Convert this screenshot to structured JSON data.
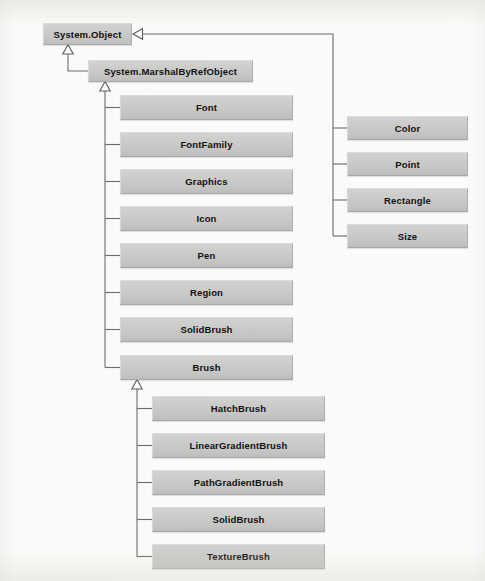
{
  "diagram": {
    "type": "uml-class-inheritance",
    "style": {
      "background": "#fbfbfa",
      "node_fill": "#c9c9c7",
      "node_border": "#a9a9a7",
      "line_color": "#6b6b6b",
      "text_color": "#111111"
    },
    "nodes": [
      {
        "id": "system-object",
        "label": "System.Object",
        "x": 43,
        "y": 23,
        "w": 89,
        "h": 22
      },
      {
        "id": "system-marshalbyrefobject",
        "label": "System.MarshalByRefObject",
        "x": 88,
        "y": 60,
        "w": 165,
        "h": 22
      },
      {
        "id": "font",
        "label": "Font",
        "x": 120,
        "y": 95,
        "w": 173,
        "h": 25
      },
      {
        "id": "fontfamily",
        "label": "FontFamily",
        "x": 120,
        "y": 132,
        "w": 173,
        "h": 25
      },
      {
        "id": "graphics",
        "label": "Graphics",
        "x": 120,
        "y": 169,
        "w": 173,
        "h": 25
      },
      {
        "id": "icon",
        "label": "Icon",
        "x": 120,
        "y": 206,
        "w": 173,
        "h": 25
      },
      {
        "id": "pen",
        "label": "Pen",
        "x": 120,
        "y": 243,
        "w": 173,
        "h": 25
      },
      {
        "id": "region",
        "label": "Region",
        "x": 120,
        "y": 280,
        "w": 173,
        "h": 25
      },
      {
        "id": "solidbrush-top",
        "label": "SolidBrush",
        "x": 120,
        "y": 317,
        "w": 173,
        "h": 25
      },
      {
        "id": "brush",
        "label": "Brush",
        "x": 120,
        "y": 355,
        "w": 173,
        "h": 25
      },
      {
        "id": "color",
        "label": "Color",
        "x": 347,
        "y": 116,
        "w": 121,
        "h": 24
      },
      {
        "id": "point",
        "label": "Point",
        "x": 347,
        "y": 152,
        "w": 121,
        "h": 24
      },
      {
        "id": "rectangle",
        "label": "Rectangle",
        "x": 347,
        "y": 188,
        "w": 121,
        "h": 24
      },
      {
        "id": "size",
        "label": "Size",
        "x": 347,
        "y": 224,
        "w": 121,
        "h": 24
      },
      {
        "id": "hatchbrush",
        "label": "HatchBrush",
        "x": 152,
        "y": 396,
        "w": 173,
        "h": 25
      },
      {
        "id": "lineargradientbrush",
        "label": "LinearGradientBrush",
        "x": 152,
        "y": 433,
        "w": 173,
        "h": 25
      },
      {
        "id": "pathgradientbrush",
        "label": "PathGradientBrush",
        "x": 152,
        "y": 470,
        "w": 173,
        "h": 25
      },
      {
        "id": "solidbrush-bottom",
        "label": "SolidBrush",
        "x": 152,
        "y": 507,
        "w": 173,
        "h": 25
      },
      {
        "id": "texturebrush",
        "label": "TextureBrush",
        "x": 152,
        "y": 544,
        "w": 173,
        "h": 25
      }
    ],
    "edges": [
      {
        "from": "system-marshalbyrefobject",
        "to": "system-object",
        "kind": "generalization"
      },
      {
        "from": "font",
        "to": "system-marshalbyrefobject",
        "kind": "generalization"
      },
      {
        "from": "fontfamily",
        "to": "system-marshalbyrefobject",
        "kind": "generalization"
      },
      {
        "from": "graphics",
        "to": "system-marshalbyrefobject",
        "kind": "generalization"
      },
      {
        "from": "icon",
        "to": "system-marshalbyrefobject",
        "kind": "generalization"
      },
      {
        "from": "pen",
        "to": "system-marshalbyrefobject",
        "kind": "generalization"
      },
      {
        "from": "region",
        "to": "system-marshalbyrefobject",
        "kind": "generalization"
      },
      {
        "from": "solidbrush-top",
        "to": "system-marshalbyrefobject",
        "kind": "generalization"
      },
      {
        "from": "brush",
        "to": "system-marshalbyrefobject",
        "kind": "generalization"
      },
      {
        "from": "color",
        "to": "system-object",
        "kind": "generalization"
      },
      {
        "from": "point",
        "to": "system-object",
        "kind": "generalization"
      },
      {
        "from": "rectangle",
        "to": "system-object",
        "kind": "generalization"
      },
      {
        "from": "size",
        "to": "system-object",
        "kind": "generalization"
      },
      {
        "from": "hatchbrush",
        "to": "brush",
        "kind": "generalization"
      },
      {
        "from": "lineargradientbrush",
        "to": "brush",
        "kind": "generalization"
      },
      {
        "from": "pathgradientbrush",
        "to": "brush",
        "kind": "generalization"
      },
      {
        "from": "solidbrush-bottom",
        "to": "brush",
        "kind": "generalization"
      },
      {
        "from": "texturebrush",
        "to": "brush",
        "kind": "generalization"
      }
    ],
    "connectors": {
      "left_trunk_object_x": 68,
      "left_trunk_marshal_x": 105,
      "brush_trunk_x": 137,
      "right_trunk_x": 333,
      "right_trunk_top_y": 31,
      "object_arrow_y": 34
    }
  }
}
